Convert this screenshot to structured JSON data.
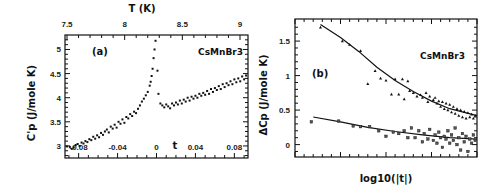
{
  "chart_data": [
    {
      "type": "scatter",
      "panel": "(a)",
      "annotation": "CsMnBr3",
      "ylabel": "C'p (J/mole K)",
      "xlabel": "t",
      "top_xlabel": "T (K)",
      "xlim": [
        -0.094,
        0.094
      ],
      "ylim": [
        2.75,
        5.3
      ],
      "xticks": [
        -0.08,
        -0.04,
        0,
        0.04,
        0.08
      ],
      "xtick_labels": [
        "-0.08",
        "-0.04",
        "0",
        "0.04",
        "0.08"
      ],
      "yticks": [
        3,
        3.5,
        4,
        4.5,
        5
      ],
      "ytick_labels": [
        "3",
        "3.5",
        "4",
        "4.5",
        "5"
      ],
      "top_xticks": [
        7.5,
        8,
        8.5,
        9
      ],
      "top_xtick_labels": [
        "7.5",
        "8",
        "8.5",
        "9"
      ],
      "grid": false,
      "series": [
        {
          "name": "data",
          "points": [
            [
              -0.092,
              2.99
            ],
            [
              -0.089,
              2.98
            ],
            [
              -0.087,
              2.94
            ],
            [
              -0.085,
              2.97
            ],
            [
              -0.083,
              3.02
            ],
            [
              -0.081,
              3.04
            ],
            [
              -0.079,
              3.0
            ],
            [
              -0.077,
              3.07
            ],
            [
              -0.075,
              3.05
            ],
            [
              -0.073,
              3.1
            ],
            [
              -0.071,
              3.08
            ],
            [
              -0.069,
              3.14
            ],
            [
              -0.067,
              3.12
            ],
            [
              -0.065,
              3.19
            ],
            [
              -0.063,
              3.15
            ],
            [
              -0.061,
              3.22
            ],
            [
              -0.059,
              3.18
            ],
            [
              -0.057,
              3.27
            ],
            [
              -0.055,
              3.23
            ],
            [
              -0.053,
              3.3
            ],
            [
              -0.051,
              3.34
            ],
            [
              -0.049,
              3.28
            ],
            [
              -0.047,
              3.4
            ],
            [
              -0.045,
              3.36
            ],
            [
              -0.043,
              3.44
            ],
            [
              -0.041,
              3.38
            ],
            [
              -0.039,
              3.5
            ],
            [
              -0.037,
              3.46
            ],
            [
              -0.035,
              3.55
            ],
            [
              -0.033,
              3.48
            ],
            [
              -0.031,
              3.6
            ],
            [
              -0.029,
              3.57
            ],
            [
              -0.027,
              3.66
            ],
            [
              -0.025,
              3.62
            ],
            [
              -0.023,
              3.71
            ],
            [
              -0.021,
              3.68
            ],
            [
              -0.019,
              3.77
            ],
            [
              -0.017,
              3.84
            ],
            [
              -0.015,
              3.92
            ],
            [
              -0.013,
              3.98
            ],
            [
              -0.011,
              4.05
            ],
            [
              -0.009,
              4.12
            ],
            [
              -0.007,
              4.25
            ],
            [
              -0.006,
              4.33
            ],
            [
              -0.005,
              4.45
            ],
            [
              -0.004,
              4.6
            ],
            [
              -0.003,
              4.82
            ],
            [
              -0.002,
              5.0
            ],
            [
              -0.001,
              5.18
            ],
            [
              0.001,
              4.56
            ],
            [
              0.002,
              4.08
            ],
            [
              0.004,
              3.88
            ],
            [
              0.006,
              3.84
            ],
            [
              0.008,
              3.8
            ],
            [
              0.01,
              3.86
            ],
            [
              0.012,
              3.82
            ],
            [
              0.014,
              3.78
            ],
            [
              0.016,
              3.88
            ],
            [
              0.018,
              3.84
            ],
            [
              0.02,
              3.9
            ],
            [
              0.022,
              3.86
            ],
            [
              0.024,
              3.94
            ],
            [
              0.026,
              3.88
            ],
            [
              0.028,
              3.96
            ],
            [
              0.03,
              3.92
            ],
            [
              0.032,
              4.0
            ],
            [
              0.034,
              3.94
            ],
            [
              0.036,
              4.02
            ],
            [
              0.038,
              3.98
            ],
            [
              0.04,
              4.04
            ],
            [
              0.042,
              4.0
            ],
            [
              0.044,
              4.08
            ],
            [
              0.046,
              4.04
            ],
            [
              0.048,
              4.1
            ],
            [
              0.05,
              4.06
            ],
            [
              0.052,
              4.14
            ],
            [
              0.054,
              4.08
            ],
            [
              0.056,
              4.18
            ],
            [
              0.058,
              4.12
            ],
            [
              0.06,
              4.2
            ],
            [
              0.062,
              4.16
            ],
            [
              0.064,
              4.24
            ],
            [
              0.066,
              4.18
            ],
            [
              0.068,
              4.28
            ],
            [
              0.07,
              4.22
            ],
            [
              0.072,
              4.3
            ],
            [
              0.074,
              4.26
            ],
            [
              0.076,
              4.34
            ],
            [
              0.078,
              4.28
            ],
            [
              0.08,
              4.38
            ],
            [
              0.082,
              4.32
            ],
            [
              0.084,
              4.4
            ],
            [
              0.086,
              4.34
            ],
            [
              0.088,
              4.44
            ],
            [
              0.09,
              4.38
            ],
            [
              0.092,
              4.46
            ]
          ]
        }
      ]
    },
    {
      "type": "scatter",
      "panel": "(b)",
      "annotation": "CsMnBr3",
      "ylabel": "ΔCp (J/mole K)",
      "xlabel": "log10(|t|)",
      "xlim": [
        0,
        1
      ],
      "ylim": [
        -0.18,
        1.82
      ],
      "yticks": [
        0,
        0.5,
        1,
        1.5
      ],
      "ytick_labels": [
        "0",
        "0.5",
        "1",
        "1.5"
      ],
      "grid": false,
      "series": [
        {
          "name": "upper (triangles)",
          "marker": "triangle",
          "points": [
            [
              0.14,
              1.7
            ],
            [
              0.26,
              1.5
            ],
            [
              0.3,
              1.45
            ],
            [
              0.36,
              1.36
            ],
            [
              0.4,
              0.88
            ],
            [
              0.44,
              1.07
            ],
            [
              0.47,
              0.96
            ],
            [
              0.5,
              0.93
            ],
            [
              0.53,
              0.73
            ],
            [
              0.55,
              0.95
            ],
            [
              0.57,
              0.73
            ],
            [
              0.59,
              0.95
            ],
            [
              0.6,
              0.66
            ],
            [
              0.62,
              0.92
            ],
            [
              0.63,
              0.78
            ],
            [
              0.65,
              0.75
            ],
            [
              0.67,
              0.7
            ],
            [
              0.69,
              0.72
            ],
            [
              0.7,
              0.68
            ],
            [
              0.72,
              0.75
            ],
            [
              0.73,
              0.62
            ],
            [
              0.74,
              0.7
            ],
            [
              0.76,
              0.65
            ],
            [
              0.77,
              0.68
            ],
            [
              0.78,
              0.6
            ],
            [
              0.79,
              0.63
            ],
            [
              0.8,
              0.55
            ],
            [
              0.81,
              0.62
            ],
            [
              0.82,
              0.52
            ],
            [
              0.83,
              0.6
            ],
            [
              0.84,
              0.5
            ],
            [
              0.85,
              0.58
            ],
            [
              0.86,
              0.47
            ],
            [
              0.87,
              0.55
            ],
            [
              0.88,
              0.45
            ],
            [
              0.89,
              0.52
            ],
            [
              0.9,
              0.42
            ],
            [
              0.91,
              0.5
            ],
            [
              0.92,
              0.4
            ],
            [
              0.93,
              0.48
            ],
            [
              0.94,
              0.38
            ],
            [
              0.95,
              0.46
            ],
            [
              0.96,
              0.4
            ],
            [
              0.97,
              0.44
            ],
            [
              0.98,
              0.38
            ],
            [
              0.99,
              0.42
            ]
          ]
        },
        {
          "name": "lower (squares)",
          "marker": "square",
          "points": [
            [
              0.09,
              0.33
            ],
            [
              0.24,
              0.34
            ],
            [
              0.32,
              0.27
            ],
            [
              0.36,
              0.26
            ],
            [
              0.41,
              0.26
            ],
            [
              0.46,
              0.2
            ],
            [
              0.5,
              0.12
            ],
            [
              0.54,
              0.18
            ],
            [
              0.57,
              0.16
            ],
            [
              0.6,
              0.2
            ],
            [
              0.62,
              0.1
            ],
            [
              0.64,
              0.24
            ],
            [
              0.66,
              0.1
            ],
            [
              0.68,
              0.2
            ],
            [
              0.7,
              0.04
            ],
            [
              0.71,
              0.16
            ],
            [
              0.73,
              0.08
            ],
            [
              0.74,
              0.22
            ],
            [
              0.76,
              0.06
            ],
            [
              0.77,
              0.14
            ],
            [
              0.78,
              0.02
            ],
            [
              0.79,
              0.18
            ],
            [
              0.8,
              0.1
            ],
            [
              0.81,
              -0.04
            ],
            [
              0.82,
              0.12
            ],
            [
              0.83,
              0.08
            ],
            [
              0.84,
              0.2
            ],
            [
              0.85,
              0.02
            ],
            [
              0.86,
              0.14
            ],
            [
              0.87,
              0.06
            ],
            [
              0.88,
              0.24
            ],
            [
              0.89,
              0.0
            ],
            [
              0.9,
              0.1
            ],
            [
              0.91,
              -0.08
            ],
            [
              0.92,
              0.16
            ],
            [
              0.93,
              0.04
            ],
            [
              0.94,
              0.12
            ],
            [
              0.95,
              -0.1
            ],
            [
              0.96,
              0.08
            ],
            [
              0.97,
              0.02
            ],
            [
              0.98,
              0.14
            ],
            [
              0.99,
              0.06
            ]
          ]
        }
      ],
      "fits": [
        {
          "name": "upper fit",
          "points": [
            [
              0.14,
              1.74
            ],
            [
              0.25,
              1.55
            ],
            [
              0.35,
              1.35
            ],
            [
              0.45,
              1.12
            ],
            [
              0.55,
              0.93
            ],
            [
              0.65,
              0.77
            ],
            [
              0.75,
              0.63
            ],
            [
              0.85,
              0.52
            ],
            [
              1.0,
              0.42
            ]
          ]
        },
        {
          "name": "lower fit",
          "points": [
            [
              0.1,
              0.4
            ],
            [
              0.25,
              0.33
            ],
            [
              0.4,
              0.25
            ],
            [
              0.55,
              0.19
            ],
            [
              0.7,
              0.14
            ],
            [
              0.85,
              0.1
            ],
            [
              1.0,
              0.08
            ]
          ]
        }
      ]
    }
  ]
}
